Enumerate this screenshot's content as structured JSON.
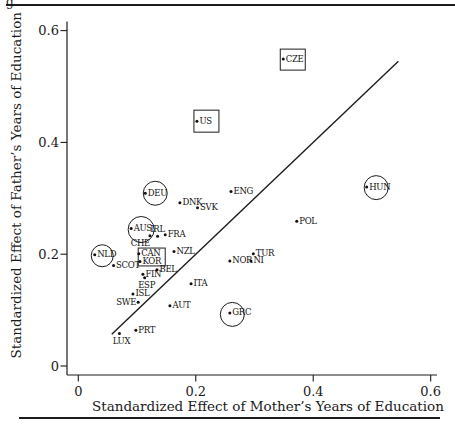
{
  "figure": {
    "cropped_text_fragment": "g"
  },
  "chart_data": {
    "type": "scatter",
    "title": "",
    "xlabel": "Standardized Effect of Mother’s Years of Education",
    "ylabel": "Standardized Effect of Father’s Years of Education",
    "xlim": [
      0,
      0.6
    ],
    "ylim": [
      0,
      0.6
    ],
    "xticks": [
      "0",
      "0.2",
      "0.4",
      "0.6"
    ],
    "yticks": [
      "0",
      "0.2",
      "0.4",
      "0.6"
    ],
    "grid": false,
    "legend": false,
    "reference_line": {
      "type": "identity",
      "x_start": 0.057,
      "x_end": 0.545
    },
    "points": [
      {
        "label": "CZE",
        "x": 0.349,
        "y": 0.549,
        "frame": "box",
        "label_pos": "right"
      },
      {
        "label": "US",
        "x": 0.202,
        "y": 0.438,
        "frame": "box",
        "label_pos": "right"
      },
      {
        "label": "HUN",
        "x": 0.491,
        "y": 0.32,
        "frame": "circle",
        "label_pos": "right"
      },
      {
        "label": "ENG",
        "x": 0.26,
        "y": 0.312,
        "frame": null,
        "label_pos": "right"
      },
      {
        "label": "DEU",
        "x": 0.114,
        "y": 0.309,
        "frame": "circle",
        "label_pos": "right"
      },
      {
        "label": "DNK",
        "x": 0.173,
        "y": 0.292,
        "frame": null,
        "label_pos": "right"
      },
      {
        "label": "SVK",
        "x": 0.203,
        "y": 0.283,
        "frame": null,
        "label_pos": "right"
      },
      {
        "label": "POL",
        "x": 0.372,
        "y": 0.259,
        "frame": null,
        "label_pos": "right"
      },
      {
        "label": "AUS",
        "x": 0.09,
        "y": 0.246,
        "frame": "circle",
        "label_pos": "right"
      },
      {
        "label": "FRA",
        "x": 0.148,
        "y": 0.235,
        "frame": null,
        "label_pos": "right"
      },
      {
        "label": "CHE",
        "x": 0.122,
        "y": 0.233,
        "frame": null,
        "label_pos": "below-left"
      },
      {
        "label": "IRL",
        "x": 0.135,
        "y": 0.232,
        "frame": null,
        "label_pos": "above"
      },
      {
        "label": "NZL",
        "x": 0.163,
        "y": 0.205,
        "frame": null,
        "label_pos": "right"
      },
      {
        "label": "TUR",
        "x": 0.298,
        "y": 0.201,
        "frame": null,
        "label_pos": "right"
      },
      {
        "label": "CAN",
        "x": 0.103,
        "y": 0.201,
        "frame": null,
        "label_pos": "right"
      },
      {
        "label": "NLD",
        "x": 0.028,
        "y": 0.199,
        "frame": "circle",
        "label_pos": "right"
      },
      {
        "label": "NOR",
        "x": 0.258,
        "y": 0.188,
        "frame": null,
        "label_pos": "right"
      },
      {
        "label": "NI",
        "x": 0.294,
        "y": 0.188,
        "frame": null,
        "label_pos": "right"
      },
      {
        "label": "KOR",
        "x": 0.105,
        "y": 0.187,
        "frame": null,
        "label_pos": "right"
      },
      {
        "label": "SCOT",
        "x": 0.06,
        "y": 0.18,
        "frame": null,
        "label_pos": "right"
      },
      {
        "label": "BEL",
        "x": 0.134,
        "y": 0.172,
        "frame": null,
        "label_pos": "right"
      },
      {
        "label": "FIN",
        "x": 0.11,
        "y": 0.164,
        "frame": null,
        "label_pos": "right"
      },
      {
        "label": "ESP",
        "x": 0.113,
        "y": 0.158,
        "frame": null,
        "label_pos": "below"
      },
      {
        "label": "ITA",
        "x": 0.192,
        "y": 0.147,
        "frame": null,
        "label_pos": "right"
      },
      {
        "label": "ISL",
        "x": 0.093,
        "y": 0.129,
        "frame": null,
        "label_pos": "right"
      },
      {
        "label": "SWE",
        "x": 0.102,
        "y": 0.114,
        "frame": null,
        "label_pos": "left"
      },
      {
        "label": "AUT",
        "x": 0.156,
        "y": 0.108,
        "frame": null,
        "label_pos": "right"
      },
      {
        "label": "GRC",
        "x": 0.258,
        "y": 0.095,
        "frame": "circle",
        "label_pos": "right"
      },
      {
        "label": "PRT",
        "x": 0.098,
        "y": 0.064,
        "frame": null,
        "label_pos": "right"
      },
      {
        "label": "LUX",
        "x": 0.07,
        "y": 0.058,
        "frame": null,
        "label_pos": "below"
      }
    ],
    "group_frames": [
      {
        "type": "box",
        "members": [
          "CAN",
          "KOR"
        ],
        "x_range": [
          0.102,
          0.148
        ],
        "y_range": [
          0.179,
          0.211
        ]
      }
    ]
  }
}
